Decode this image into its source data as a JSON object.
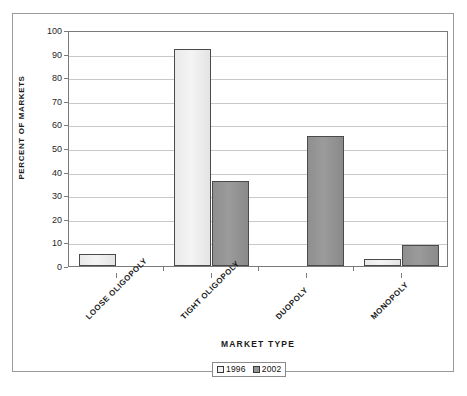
{
  "chart_data": {
    "type": "bar",
    "title": "",
    "xlabel": "MARKET TYPE",
    "ylabel": "PERCENT OF MARKETS",
    "categories": [
      "LOOSE OLIGOPOLY",
      "TIGHT OLIGOPOLY",
      "DUOPOLY",
      "MONOPOLY"
    ],
    "series": [
      {
        "name": "1996",
        "color": "#f0f0f0",
        "values": [
          5,
          92,
          0,
          3
        ]
      },
      {
        "name": "2002",
        "color": "#949494",
        "values": [
          0,
          36,
          55,
          9
        ]
      }
    ],
    "ylim": [
      0,
      100
    ],
    "yticks": [
      0,
      10,
      20,
      30,
      40,
      50,
      60,
      70,
      80,
      90,
      100
    ],
    "ytick_labels": [
      "0",
      "10",
      "20",
      "30",
      "40",
      "50",
      "60",
      "70",
      "80",
      "90",
      "100"
    ],
    "grid": true,
    "legend_position": "bottom"
  },
  "legend": {
    "items": [
      {
        "label": "1996"
      },
      {
        "label": "2002"
      }
    ]
  }
}
